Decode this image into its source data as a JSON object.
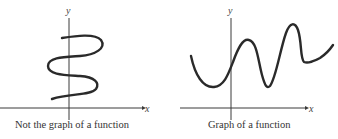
{
  "left_panel": {
    "y_axis_label": "y",
    "x_axis_label": "x",
    "caption": "Not the graph of a function"
  },
  "right_panel": {
    "y_axis_label": "y",
    "x_axis_label": "x",
    "caption": "Graph of a function"
  },
  "colors": {
    "curve": "#2a2a2a",
    "axis": "#3a3a3a",
    "text": "#333333"
  }
}
